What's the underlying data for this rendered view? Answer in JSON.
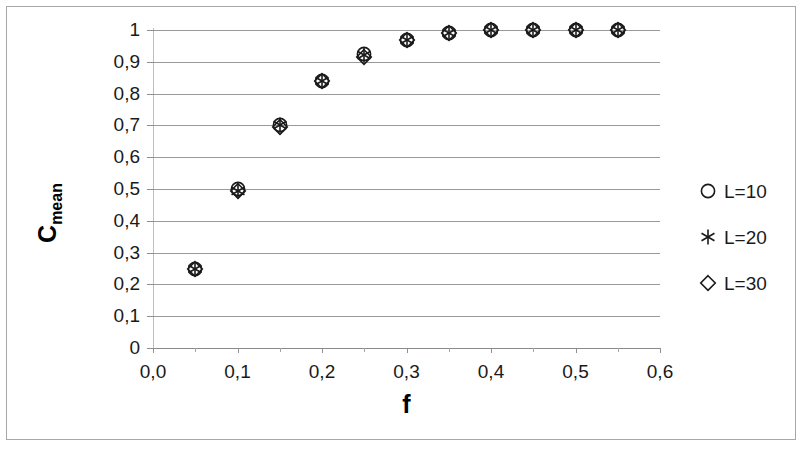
{
  "chart_data": {
    "type": "scatter",
    "title": "",
    "xlabel": "f",
    "ylabel_main": "C",
    "ylabel_sub": "mean",
    "xlim": [
      0.0,
      0.6
    ],
    "ylim": [
      0,
      1
    ],
    "grid": true,
    "legend_position": "right",
    "x": [
      0.05,
      0.1,
      0.15,
      0.2,
      0.25,
      0.3,
      0.35,
      0.4,
      0.45,
      0.5,
      0.55
    ],
    "series": [
      {
        "name": "L=10",
        "marker": "circle",
        "values": [
          0.25,
          0.5,
          0.7,
          0.84,
          0.925,
          0.97,
          0.99,
          1.0,
          1.0,
          1.0,
          1.0
        ]
      },
      {
        "name": "L=20",
        "marker": "asterisk",
        "values": [
          0.25,
          0.495,
          0.7,
          0.84,
          0.92,
          0.97,
          0.99,
          1.0,
          1.0,
          1.0,
          1.0
        ]
      },
      {
        "name": "L=30",
        "marker": "diamond",
        "values": [
          0.25,
          0.495,
          0.695,
          0.84,
          0.915,
          0.968,
          0.99,
          1.0,
          1.0,
          1.0,
          1.0
        ]
      }
    ],
    "x_tick_labels": [
      "0,0",
      "0,1",
      "0,2",
      "0,3",
      "0,4",
      "0,5",
      "0,6"
    ],
    "x_tick_values": [
      0.0,
      0.1,
      0.2,
      0.3,
      0.4,
      0.5,
      0.6
    ],
    "x_minor_tick_values": [
      0.05,
      0.15,
      0.25,
      0.35,
      0.45,
      0.55
    ],
    "y_tick_labels": [
      "1",
      "0,9",
      "0,8",
      "0,7",
      "0,6",
      "0,5",
      "0,4",
      "0,3",
      "0,2",
      "0,1",
      "0"
    ],
    "y_tick_values": [
      1,
      0.9,
      0.8,
      0.7,
      0.6,
      0.5,
      0.4,
      0.3,
      0.2,
      0.1,
      0
    ],
    "legend": [
      {
        "label": "L=10",
        "marker": "circle"
      },
      {
        "label": "L=20",
        "marker": "asterisk"
      },
      {
        "label": "L=30",
        "marker": "diamond"
      }
    ],
    "colors": {
      "marker": "#1a1a1a",
      "gridline": "#9a9a9a",
      "axis": "#8a8a8a",
      "text": "#1a1a1a",
      "background": "#ffffff",
      "frame": "#a8a8a8"
    }
  }
}
